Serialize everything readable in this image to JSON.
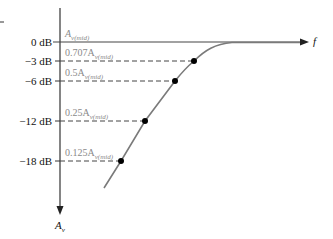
{
  "diagram": {
    "type": "bode-plot-low-frequency-rolloff",
    "x_axis_label": "f",
    "y_axis_label": "A",
    "y_axis_label_sub": "v",
    "db_levels": [
      {
        "label": "0 dB",
        "gain_label": "A",
        "gain_sub": "v(mid)",
        "value_db": 0
      },
      {
        "label": "−3 dB",
        "gain_label": "0.707A",
        "gain_sub": "v(mid)",
        "value_db": -3
      },
      {
        "label": "−6 dB",
        "gain_label": "0.5A",
        "gain_sub": "v(mid)",
        "value_db": -6
      },
      {
        "label": "−12 dB",
        "gain_label": "0.25A",
        "gain_sub": "v(mid)",
        "value_db": -12
      },
      {
        "label": "−18 dB",
        "gain_label": "0.125A",
        "gain_sub": "v(mid)",
        "value_db": -18
      }
    ],
    "colors": {
      "axis": "#333333",
      "curve": "#7a7a7a",
      "dashed": "#444444",
      "dot": "#000000",
      "gain_text": "#8a8a8a"
    }
  }
}
